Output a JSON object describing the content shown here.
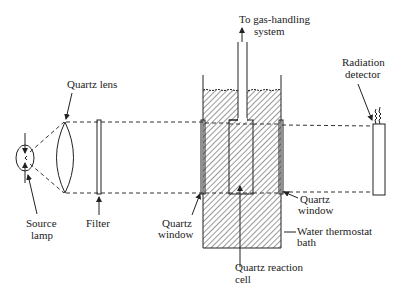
{
  "diagram": {
    "type": "photochemical-apparatus-schematic",
    "labels": {
      "gas_handling_line1": "To gas-handling",
      "gas_handling_line2": "system",
      "radiation_detector_line1": "Radiation",
      "radiation_detector_line2": "detector",
      "quartz_lens": "Quartz lens",
      "source_lamp_line1": "Source",
      "source_lamp_line2": "lamp",
      "filter": "Filter",
      "quartz_window_left_line1": "Quartz",
      "quartz_window_left_line2": "window",
      "quartz_window_right_line1": "Quartz",
      "quartz_window_right_line2": "window",
      "water_bath_line1": "Water thermostat",
      "water_bath_line2": "bath",
      "reaction_cell_line1": "Quartz reaction",
      "reaction_cell_line2": "cell"
    },
    "components": [
      "Source lamp",
      "Quartz lens",
      "Filter",
      "Quartz window",
      "Quartz reaction cell",
      "Quartz window",
      "Water thermostat bath",
      "Radiation detector",
      "To gas-handling system"
    ],
    "colors": {
      "line": "#222222",
      "background": "#ffffff"
    }
  }
}
